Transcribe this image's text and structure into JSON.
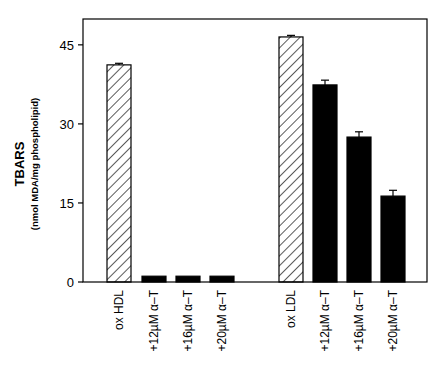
{
  "chart_data": {
    "type": "bar",
    "title": "",
    "ylabel": "TBARS",
    "ylabel_sub": "(nmol MDA/mg phospholipid)",
    "xlabel": "",
    "ylim": [
      0,
      50
    ],
    "yticks": [
      0,
      15,
      30,
      45
    ],
    "grid": false,
    "legend": null,
    "groups": [
      {
        "name": "HDL",
        "categories": [
          "ox HDL",
          "+12µM α–T",
          "+16µM α–T",
          "+20µM α–T"
        ],
        "values": [
          41.2,
          1.1,
          1.1,
          1.1
        ],
        "errors": [
          0.3,
          0,
          0,
          0
        ],
        "fills": [
          "hatched",
          "solid",
          "solid",
          "solid"
        ]
      },
      {
        "name": "LDL",
        "categories": [
          "ox LDL",
          "+12µM α–T",
          "+16µM α–T",
          "+20µM α–T"
        ],
        "values": [
          46.5,
          37.4,
          27.5,
          16.3
        ],
        "errors": [
          0.3,
          0.9,
          1.0,
          1.1
        ],
        "fills": [
          "hatched",
          "solid",
          "solid",
          "solid"
        ]
      }
    ]
  },
  "axis": {
    "tick_labels": [
      "0",
      "15",
      "30",
      "45"
    ]
  },
  "colors": {
    "solid": "#000000",
    "hatch": "#000000",
    "background": "#ffffff"
  }
}
